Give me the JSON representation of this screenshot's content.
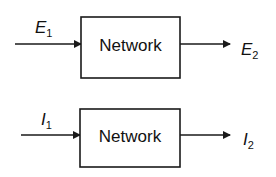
{
  "diagrams": [
    {
      "block_label": "Network",
      "input": {
        "symbol": "E",
        "subscript": "1"
      },
      "output": {
        "symbol": "E",
        "subscript": "2"
      }
    },
    {
      "block_label": "Network",
      "input": {
        "symbol": "I",
        "subscript": "1"
      },
      "output": {
        "symbol": "I",
        "subscript": "2"
      }
    }
  ],
  "colors": {
    "stroke": "#1a1a1a",
    "background": "#ffffff"
  }
}
